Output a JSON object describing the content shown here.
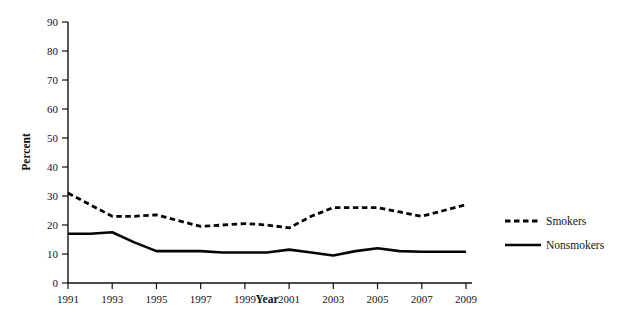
{
  "chart_data": {
    "type": "line",
    "title": "",
    "xlabel": "Year",
    "ylabel": "Percent",
    "grid": false,
    "legend_position": "right",
    "xlim": [
      1991,
      2009
    ],
    "ylim": [
      0,
      90
    ],
    "x": [
      1991,
      1992,
      1993,
      1994,
      1995,
      1996,
      1997,
      1998,
      1999,
      2000,
      2001,
      2002,
      2003,
      2004,
      2005,
      2006,
      2007,
      2008,
      2009
    ],
    "xtick_labels": [
      "1991",
      "1993",
      "1995",
      "1997",
      "1999",
      "2001",
      "2003",
      "2005",
      "2007",
      "2009"
    ],
    "xtick_values": [
      1991,
      1993,
      1995,
      1997,
      1999,
      2001,
      2003,
      2005,
      2007,
      2009
    ],
    "ytick_labels": [
      "0",
      "10",
      "20",
      "30",
      "40",
      "50",
      "60",
      "70",
      "80",
      "90"
    ],
    "ytick_values": [
      0,
      10,
      20,
      30,
      40,
      50,
      60,
      70,
      80,
      90
    ],
    "series": [
      {
        "name": "Smokers",
        "style": "dashed",
        "color": "#050505",
        "values": [
          31,
          27,
          23,
          23,
          23.5,
          21.5,
          19.5,
          20,
          20.5,
          20,
          19,
          23,
          26,
          26,
          26,
          24.5,
          23,
          25,
          27
        ]
      },
      {
        "name": "Nonsmokers",
        "style": "solid",
        "color": "#050505",
        "values": [
          17,
          17,
          17.5,
          14,
          11,
          11,
          11,
          10.5,
          10.5,
          10.5,
          11.5,
          10.5,
          9.5,
          11,
          12,
          11,
          10.8,
          10.8,
          10.8
        ]
      }
    ]
  },
  "legend": {
    "items": [
      {
        "label": "Smokers",
        "style": "dashed"
      },
      {
        "label": "Nonsmokers",
        "style": "solid"
      }
    ]
  },
  "axes": {
    "x_title": "Year",
    "y_title": "Percent"
  }
}
